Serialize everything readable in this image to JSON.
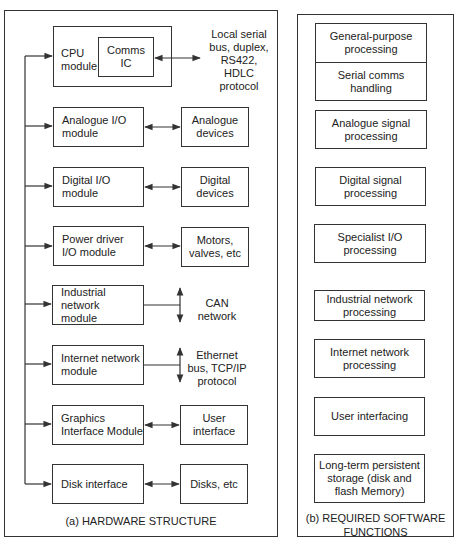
{
  "hardware": {
    "caption": "(a) HARDWARE STRUCTURE",
    "cpu": {
      "label": "CPU\nmodule",
      "comms": "Comms\nIC",
      "external": "Local serial\nbus, duplex,\nRS422,\nHDLC\nprotocol"
    },
    "modules": [
      {
        "label": "Analogue I/O\nmodule",
        "target": "Analogue\ndevices",
        "connection": "bidirectional"
      },
      {
        "label": "Digital I/O\nmodule",
        "target": "Digital\ndevices",
        "connection": "bidirectional"
      },
      {
        "label": "Power driver\nI/O module",
        "target": "Motors,\nvalves, etc",
        "connection": "bidirectional"
      },
      {
        "label": "Industrial network\nmodule",
        "target": "CAN\nnetwork",
        "connection": "bus"
      },
      {
        "label": "Internet network\nmodule",
        "target": "Ethernet\nbus, TCP/IP\nprotocol",
        "connection": "bus"
      },
      {
        "label": "Graphics\nInterface Module",
        "target": "User\ninterface",
        "connection": "bidirectional"
      },
      {
        "label": "Disk interface",
        "target": "Disks, etc",
        "connection": "bidirectional"
      }
    ]
  },
  "software": {
    "caption": "(b) REQUIRED SOFTWARE\nFUNCTIONS",
    "functions": [
      "General-purpose\nprocessing",
      "Serial comms\nhandling",
      "Analogue signal\nprocessing",
      "Digital signal\nprocessing",
      "Specialist I/O\nprocessing",
      "Industrial network\nprocessing",
      "Internet network\nprocessing",
      "User interfacing",
      "Long-term persistent\nstorage (disk and\nflash Memory)"
    ]
  },
  "colors": {
    "line": "#333333",
    "background": "#ffffff",
    "text": "#222222"
  }
}
